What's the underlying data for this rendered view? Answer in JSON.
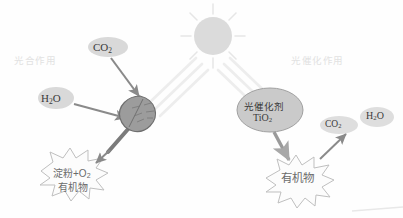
{
  "diagram": {
    "background_color": "#fefefe",
    "sections": {
      "left_label": "光合作用",
      "right_label": "光催化作用",
      "label_color": "#e2e2e2"
    },
    "sun": {
      "name": "sun",
      "fill": "#dcdcdc",
      "ray_color": "#e4e4e4",
      "center_x": 213,
      "center_y": 36,
      "radius": 19
    },
    "light_beams": {
      "color": "#ececec",
      "left_beam_label": "light-beam-left",
      "right_beam_label": "light-beam-right"
    },
    "left_branch": {
      "inputs": [
        {
          "id": "co2-left",
          "label": "CO",
          "sub": "2",
          "fill": "#d8d8d8"
        },
        {
          "id": "h2o-left",
          "label": "H",
          "sub": "2",
          "label_tail": "O",
          "fill": "#d8d8d8"
        }
      ],
      "reactor": {
        "name": "leaf",
        "fill": "#9a9a9a",
        "stroke": "#6e6e6e",
        "stem_color": "#777777"
      },
      "output": {
        "name": "starch-burst",
        "line1": "淀粉+O",
        "line1_sub": "2",
        "line2": "有机物",
        "stroke": "#bdbdbd",
        "fill": "#fcfcfc"
      }
    },
    "right_branch": {
      "catalyst": {
        "name": "photocatalyst",
        "line1": "光催化剂",
        "line2": "TiO",
        "line2_sub": "2",
        "fill": "#c9c9c9",
        "stroke": "#9f9f9f"
      },
      "outputs": [
        {
          "id": "co2-right",
          "label": "CO",
          "sub": "2",
          "fill": "#dedede"
        },
        {
          "id": "h2o-right",
          "label": "H",
          "sub": "2",
          "label_tail": "O",
          "fill": "#dedede"
        }
      ],
      "product": {
        "name": "organic-burst",
        "line1": "有机物",
        "stroke": "#bdbdbd",
        "fill": "#fcfcfc"
      }
    },
    "arrows": {
      "color": "#8a8a8a",
      "items": [
        "co2-to-leaf",
        "h2o-to-leaf",
        "leaf-to-starch",
        "catalyst-to-organic",
        "organic-to-gases"
      ]
    },
    "footer_rule_color": "#e8e8e8"
  }
}
